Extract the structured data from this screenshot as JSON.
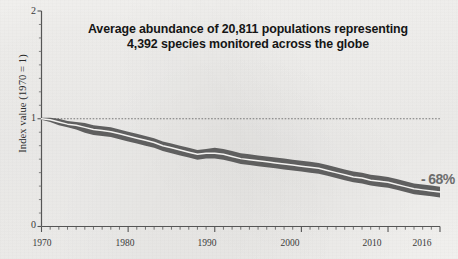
{
  "figure": {
    "background_color": "#f1f0ee",
    "title_lines": [
      "Average abundance of 20,811 populations representing",
      "4,392 species monitored across the globe"
    ],
    "end_annotation": "- 68%",
    "ylabel": "Index value (1970 = 1)",
    "ytick_labels": [
      "0",
      "1",
      "2"
    ],
    "xtick_labels": [
      "1970",
      "1980",
      "1990",
      "2000",
      "2010",
      "2016"
    ],
    "colors": {
      "band": "#575757",
      "line": "#f3f2f0",
      "axis": "#555555",
      "reference_line": "#6a6a6a",
      "annotation": "#6d6d6d",
      "title": "#151515"
    }
  },
  "chart_data": {
    "type": "line",
    "title": "Average abundance of 20,811 populations representing 4,392 species monitored across the globe",
    "subtitle": "",
    "xlabel": "",
    "ylabel": "Index value (1970 = 1)",
    "xlim": [
      1970,
      2016
    ],
    "ylim": [
      0,
      2
    ],
    "xticks": [
      1970,
      1980,
      1990,
      2000,
      2010,
      2016
    ],
    "xtick_labels": [
      "1970",
      "1980",
      "1990",
      "2000",
      "2010",
      "2016"
    ],
    "minor_xticks_interval": 1,
    "yticks": [
      0,
      1,
      2
    ],
    "ytick_labels": [
      "0",
      "1",
      "2"
    ],
    "minor_yticks_interval": 0.125,
    "grid": false,
    "legend": null,
    "reference_line": {
      "y": 1,
      "style": "dotted",
      "x_from": 1970,
      "x_to": 2016
    },
    "annotations": [
      {
        "text": "- 68%",
        "x": 2016,
        "y": 0.32,
        "color": "#6d6d6d"
      }
    ],
    "x": [
      1970,
      1971,
      1972,
      1973,
      1974,
      1975,
      1976,
      1977,
      1978,
      1979,
      1980,
      1981,
      1982,
      1983,
      1984,
      1985,
      1986,
      1987,
      1988,
      1989,
      1990,
      1991,
      1992,
      1993,
      1994,
      1995,
      1996,
      1997,
      1998,
      1999,
      2000,
      2001,
      2002,
      2003,
      2004,
      2005,
      2006,
      2007,
      2008,
      2009,
      2010,
      2011,
      2012,
      2013,
      2014,
      2015,
      2016
    ],
    "series": [
      {
        "name": "Global Living Planet Index",
        "values": [
          1.0,
          0.99,
          0.97,
          0.95,
          0.94,
          0.92,
          0.9,
          0.89,
          0.88,
          0.86,
          0.84,
          0.82,
          0.8,
          0.78,
          0.75,
          0.73,
          0.71,
          0.69,
          0.67,
          0.68,
          0.68,
          0.67,
          0.65,
          0.63,
          0.62,
          0.61,
          0.6,
          0.59,
          0.58,
          0.57,
          0.56,
          0.55,
          0.54,
          0.52,
          0.5,
          0.48,
          0.46,
          0.45,
          0.43,
          0.42,
          0.41,
          0.39,
          0.37,
          0.35,
          0.34,
          0.33,
          0.32
        ],
        "band_lower": [
          0.99,
          0.97,
          0.94,
          0.92,
          0.9,
          0.87,
          0.85,
          0.84,
          0.83,
          0.81,
          0.79,
          0.77,
          0.75,
          0.73,
          0.7,
          0.68,
          0.66,
          0.64,
          0.62,
          0.63,
          0.63,
          0.62,
          0.6,
          0.58,
          0.57,
          0.56,
          0.55,
          0.54,
          0.53,
          0.52,
          0.51,
          0.5,
          0.49,
          0.47,
          0.45,
          0.43,
          0.41,
          0.4,
          0.38,
          0.37,
          0.36,
          0.34,
          0.32,
          0.3,
          0.29,
          0.28,
          0.27
        ],
        "band_upper": [
          1.01,
          1.01,
          1.0,
          0.98,
          0.97,
          0.96,
          0.94,
          0.93,
          0.92,
          0.9,
          0.88,
          0.86,
          0.84,
          0.82,
          0.79,
          0.77,
          0.75,
          0.73,
          0.71,
          0.72,
          0.73,
          0.72,
          0.7,
          0.68,
          0.67,
          0.66,
          0.65,
          0.64,
          0.63,
          0.62,
          0.61,
          0.6,
          0.59,
          0.57,
          0.55,
          0.53,
          0.51,
          0.5,
          0.48,
          0.47,
          0.46,
          0.44,
          0.42,
          0.4,
          0.39,
          0.38,
          0.37
        ],
        "line_color": "#f3f2f0",
        "band_color": "#575757"
      }
    ]
  }
}
